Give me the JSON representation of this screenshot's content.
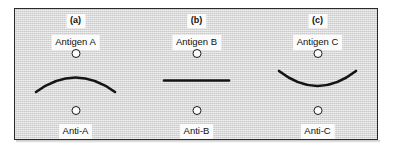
{
  "figure": {
    "background_color": "#c9c9c9",
    "frame_color": "#2a2a2a",
    "line_color": "#141414",
    "label_background": "#fbfbfb",
    "label_text_color": "#111111"
  },
  "panels": [
    {
      "letter": "(a)",
      "antigen_label": "Antigen A",
      "antibody_label": "Anti-A",
      "top_well": "antigen-well",
      "bottom_well": "antibody-well",
      "precipitin_shape": "arc-convex-up",
      "precipitin_description": "Arc curving upward, convex toward the antigen well"
    },
    {
      "letter": "(b)",
      "antigen_label": "Antigen B",
      "antibody_label": "Anti-B",
      "top_well": "antigen-well",
      "bottom_well": "antibody-well",
      "precipitin_shape": "straight-line",
      "precipitin_description": "Straight horizontal line midway between the wells"
    },
    {
      "letter": "(c)",
      "antigen_label": "Antigen C",
      "antibody_label": "Anti-C",
      "top_well": "antigen-well",
      "bottom_well": "antibody-well",
      "precipitin_shape": "arc-concave-up",
      "precipitin_description": "Arc curving downward, concave toward the antigen well"
    }
  ]
}
